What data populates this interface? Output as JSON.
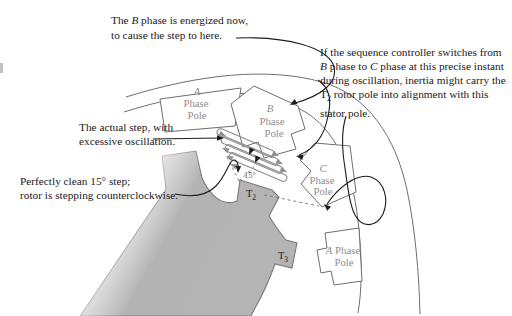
{
  "figure": {
    "annotations": {
      "b_energized": {
        "line1_pre": "The ",
        "line1_b": "B",
        "line1_post": " phase is energized now,",
        "line2": "to cause the step to here."
      },
      "actual_step": {
        "line1": "The actual step, with",
        "line2": "excessive oscillation."
      },
      "clean_step": {
        "line1": "Perfectly clean 15° step;",
        "line2": "rotor is stepping counterclockwise."
      },
      "sequence_controller": {
        "line1": "If the sequence controller switches from",
        "line2_b": "B",
        "line2_mid": " phase to ",
        "line2_c": "C",
        "line2_rest": " phase at this precise instant",
        "line3": "during oscillation, inertia might carry the",
        "line4_t": "T",
        "line4_sub": "2",
        "line4_rest": " rotor pole into alignment with this",
        "line5": "stator pole."
      }
    },
    "pole_labels": {
      "a_top": {
        "letter": "A",
        "l2": "Phase",
        "l3": "Pole"
      },
      "b": {
        "letter": "B",
        "l2": "Phase",
        "l3": "Pole"
      },
      "c": {
        "letter": "C",
        "l2": "Phase",
        "l3": "Pole"
      },
      "a_bottom": {
        "letter": "A",
        "l1_rest": " Phase",
        "l2": "Pole"
      }
    },
    "rotor_labels": {
      "t2": {
        "t": "T",
        "sub": "2"
      },
      "t3": {
        "t": "T",
        "sub": "3"
      }
    },
    "angle_label": "15°",
    "colors": {
      "rotor_fill": "#b4b4b4",
      "diagram_line": "#6e6e6e",
      "coil_line": "#8f8f8f",
      "leader_line": "#1c1c1c",
      "pole_label_text": "#8f8f8f"
    }
  }
}
